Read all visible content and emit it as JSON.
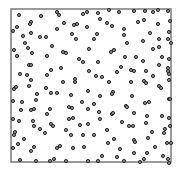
{
  "chart_data": {
    "type": "scatter",
    "title": "",
    "xlabel": "",
    "ylabel": "",
    "grid": false,
    "legend": null,
    "axes_ticks": false,
    "frame": {
      "x0": 11,
      "y0": 9,
      "x1": 171,
      "y1": 162
    },
    "colors": {
      "frame": "#7a7a7a",
      "point_stroke": "#2a2a2a",
      "point_fill": "#8a8a8a"
    },
    "points": [
      [
        19,
        15
      ],
      [
        41,
        16
      ],
      [
        57,
        12
      ],
      [
        59,
        15
      ],
      [
        83,
        14
      ],
      [
        87,
        12
      ],
      [
        31,
        22
      ],
      [
        30,
        24
      ],
      [
        17,
        27
      ],
      [
        64,
        23
      ],
      [
        74,
        25
      ],
      [
        77,
        24
      ],
      [
        87,
        27
      ],
      [
        13,
        31
      ],
      [
        31,
        33
      ],
      [
        57,
        29
      ],
      [
        72,
        34
      ],
      [
        23,
        36
      ],
      [
        40,
        37
      ],
      [
        46,
        37
      ],
      [
        76,
        39
      ],
      [
        25,
        43
      ],
      [
        28,
        48
      ],
      [
        52,
        46
      ],
      [
        89,
        49
      ],
      [
        14,
        50
      ],
      [
        32,
        53
      ],
      [
        63,
        52
      ],
      [
        66,
        53
      ],
      [
        17,
        56
      ],
      [
        47,
        56
      ],
      [
        79,
        59
      ],
      [
        83,
        62
      ],
      [
        29,
        65
      ],
      [
        31,
        65
      ],
      [
        61,
        68
      ],
      [
        89,
        71
      ],
      [
        51,
        70
      ],
      [
        20,
        74
      ],
      [
        27,
        75
      ],
      [
        47,
        75
      ],
      [
        31,
        80
      ],
      [
        63,
        82
      ],
      [
        75,
        79
      ],
      [
        75,
        82
      ],
      [
        98,
        13
      ],
      [
        109,
        10
      ],
      [
        119,
        12
      ],
      [
        134,
        11
      ],
      [
        145,
        11
      ],
      [
        153,
        12
      ],
      [
        158,
        10
      ],
      [
        168,
        11
      ],
      [
        100,
        19
      ],
      [
        107,
        23
      ],
      [
        112,
        26
      ],
      [
        138,
        22
      ],
      [
        144,
        20
      ],
      [
        158,
        24
      ],
      [
        170,
        21
      ],
      [
        124,
        29
      ],
      [
        150,
        33
      ],
      [
        169,
        32
      ],
      [
        97,
        34
      ],
      [
        124,
        35
      ],
      [
        94,
        39
      ],
      [
        143,
        41
      ],
      [
        159,
        39
      ],
      [
        168,
        39
      ],
      [
        127,
        43
      ],
      [
        171,
        43
      ],
      [
        153,
        49
      ],
      [
        159,
        47
      ],
      [
        111,
        52
      ],
      [
        114,
        50
      ],
      [
        125,
        57
      ],
      [
        136,
        57
      ],
      [
        162,
        57
      ],
      [
        169,
        59
      ],
      [
        98,
        62
      ],
      [
        143,
        61
      ],
      [
        159,
        65
      ],
      [
        168,
        68
      ],
      [
        121,
        67
      ],
      [
        131,
        70
      ],
      [
        134,
        71
      ],
      [
        146,
        71
      ],
      [
        117,
        72
      ],
      [
        168,
        71
      ],
      [
        96,
        76
      ],
      [
        102,
        77
      ],
      [
        153,
        76
      ],
      [
        169,
        74
      ],
      [
        109,
        82
      ],
      [
        131,
        82
      ],
      [
        144,
        81
      ],
      [
        146,
        83
      ],
      [
        169,
        80
      ],
      [
        14,
        89
      ],
      [
        16,
        87
      ],
      [
        29,
        86
      ],
      [
        37,
        94
      ],
      [
        46,
        88
      ],
      [
        51,
        93
      ],
      [
        57,
        93
      ],
      [
        71,
        95
      ],
      [
        88,
        91
      ],
      [
        13,
        101
      ],
      [
        22,
        102
      ],
      [
        36,
        100
      ],
      [
        82,
        102
      ],
      [
        21,
        110
      ],
      [
        31,
        110
      ],
      [
        34,
        109
      ],
      [
        50,
        109
      ],
      [
        69,
        107
      ],
      [
        72,
        108
      ],
      [
        88,
        109
      ],
      [
        47,
        114
      ],
      [
        13,
        119
      ],
      [
        19,
        121
      ],
      [
        33,
        121
      ],
      [
        69,
        119
      ],
      [
        73,
        118
      ],
      [
        34,
        126
      ],
      [
        51,
        124
      ],
      [
        53,
        126
      ],
      [
        80,
        125
      ],
      [
        88,
        124
      ],
      [
        40,
        129
      ],
      [
        45,
        133
      ],
      [
        66,
        130
      ],
      [
        15,
        132
      ],
      [
        14,
        135
      ],
      [
        71,
        135
      ],
      [
        83,
        135
      ],
      [
        24,
        139
      ],
      [
        18,
        144
      ],
      [
        13,
        148
      ],
      [
        34,
        147
      ],
      [
        60,
        146
      ],
      [
        57,
        148
      ],
      [
        73,
        148
      ],
      [
        84,
        147
      ],
      [
        31,
        151
      ],
      [
        20,
        160
      ],
      [
        36,
        161
      ],
      [
        50,
        161
      ],
      [
        54,
        159
      ],
      [
        66,
        161
      ],
      [
        88,
        161
      ],
      [
        113,
        92
      ],
      [
        112,
        94
      ],
      [
        159,
        86
      ],
      [
        161,
        88
      ],
      [
        100,
        96
      ],
      [
        132,
        96
      ],
      [
        169,
        99
      ],
      [
        170,
        99
      ],
      [
        94,
        104
      ],
      [
        126,
        106
      ],
      [
        127,
        107
      ],
      [
        145,
        103
      ],
      [
        149,
        102
      ],
      [
        99,
        112
      ],
      [
        112,
        114
      ],
      [
        113,
        113
      ],
      [
        134,
        113
      ],
      [
        147,
        116
      ],
      [
        162,
        116
      ],
      [
        100,
        119
      ],
      [
        169,
        118
      ],
      [
        122,
        122
      ],
      [
        146,
        123
      ],
      [
        129,
        126
      ],
      [
        133,
        126
      ],
      [
        165,
        129
      ],
      [
        170,
        126
      ],
      [
        107,
        130
      ],
      [
        152,
        132
      ],
      [
        164,
        133
      ],
      [
        94,
        135
      ],
      [
        114,
        139
      ],
      [
        134,
        140
      ],
      [
        135,
        142
      ],
      [
        148,
        138
      ],
      [
        108,
        143
      ],
      [
        167,
        143
      ],
      [
        171,
        143
      ],
      [
        155,
        147
      ],
      [
        120,
        149
      ],
      [
        134,
        153
      ],
      [
        147,
        153
      ],
      [
        102,
        156
      ],
      [
        163,
        156
      ],
      [
        117,
        157
      ],
      [
        144,
        159
      ],
      [
        168,
        159
      ],
      [
        98,
        161
      ],
      [
        124,
        161
      ],
      [
        140,
        162
      ],
      [
        169,
        163
      ]
    ],
    "point_radius": 1.6
  }
}
